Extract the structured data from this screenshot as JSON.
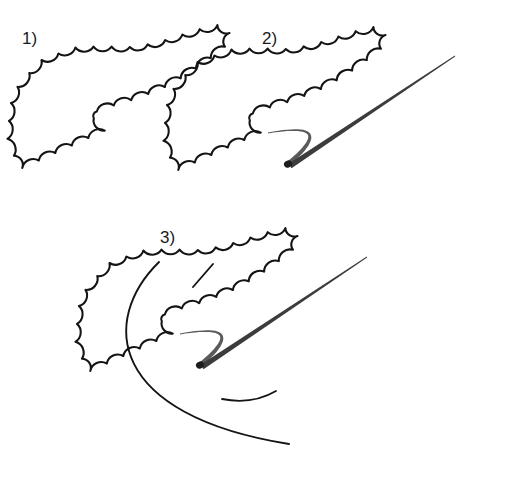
{
  "figure": {
    "type": "line-drawing-diagram",
    "background_color": "#ffffff",
    "ink_color": "#141414",
    "duct_color": "#3c3c3c",
    "width": 507,
    "height": 480
  },
  "panels": [
    {
      "id": "panel-1",
      "label": "1)",
      "label_x": 22,
      "label_y": 44,
      "description": "Scalloped lobulated outline only",
      "elements": [
        "blob-outline"
      ]
    },
    {
      "id": "panel-2",
      "label": "2)",
      "label_x": 262,
      "label_y": 44,
      "description": "Same outline with two tapering internal duct lines converging at a dark point",
      "elements": [
        "blob-outline",
        "main-duct-line",
        "secondary-duct-line",
        "convergence-point"
      ]
    },
    {
      "id": "panel-3",
      "label": "3)",
      "label_x": 160,
      "label_y": 243,
      "description": "Outline with ducts plus outer arc, inner arc and short stub line",
      "elements": [
        "blob-outline",
        "main-duct-line",
        "secondary-duct-line",
        "convergence-point",
        "outer-arc",
        "inner-arc",
        "stub-line"
      ]
    }
  ],
  "geometry": {
    "blob_path": "M 237 30 C 244 26 250 32 247 39 C 251 46 245 52 238 50 C 234 58 226 58 221 53 C 217 62 208 64 203 58 C 198 67 188 69 183 62 C 177 70 167 71 162 64 C 155 72 145 72 140 65 C 132 72 122 71 118 64 C 110 70 100 69 96 62 C 88 66 79 62 77 55 C 68 57 59 52 58 44 C 49 44 42 37 44 29 C 37 25 35 16 41 10 C 38 2 44 -5 52 -4 C 53 -12 62 -17 69 -13 C 74 -20 84 -20 89 -13 C 96 -17 105 -13 107 -5 C 115 -6 123 -1 123 7 C 131 9 135 18 131 25 C 137 31 135 41 127 44 C 129 52 122 60 114 58 C 112 66 102 70 95 65 C 89 72 79 71 74 64 C 66 67 57 62 56 54",
    "duct_main": {
      "from": [
        290,
        166
      ],
      "to": [
        455,
        56
      ],
      "width_from": 5.5,
      "width_to": 0.9
    },
    "duct_secondary": {
      "from": [
        288,
        164
      ],
      "to": [
        268,
        133
      ],
      "via": [
        340,
        120
      ],
      "width_from": 4.5,
      "width_to": 0.8
    },
    "convergence_point": [
      288,
      164
    ],
    "outer_arc": {
      "start": [
        159,
        262
      ],
      "end": [
        289,
        444
      ],
      "sweep": "counterclockwise-left"
    },
    "inner_arc": {
      "start": [
        222,
        399
      ],
      "end": [
        276,
        391
      ]
    },
    "stub_line": {
      "start": [
        213,
        264
      ],
      "end": [
        193,
        287
      ]
    },
    "panel_offsets": {
      "panel-1": [
        0,
        0
      ],
      "panel-2": [
        156,
        2
      ],
      "panel-3": [
        68,
        203
      ]
    }
  }
}
